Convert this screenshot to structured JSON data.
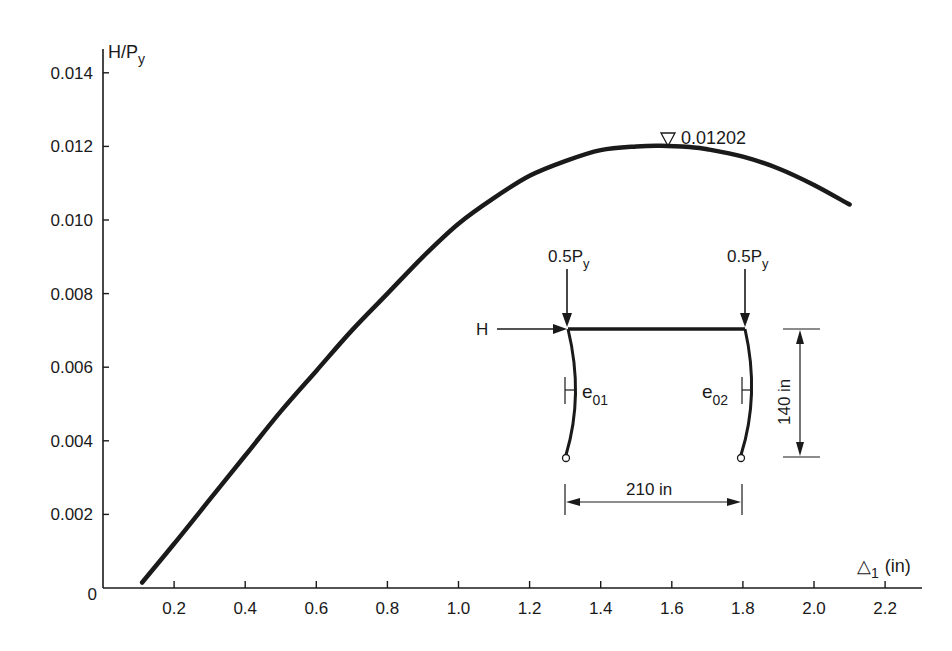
{
  "chart_data": {
    "type": "line",
    "title": "",
    "xlabel": "Δ1 (in)",
    "ylabel": "H/Py",
    "xlim": [
      0,
      2.3
    ],
    "ylim": [
      0,
      0.0145
    ],
    "grid": false,
    "legend": null,
    "x_ticks": [
      0.2,
      0.4,
      0.6,
      0.8,
      1.0,
      1.2,
      1.4,
      1.6,
      1.8,
      2.0,
      2.2
    ],
    "x_tick_labels": [
      "0.2",
      "0.4",
      "0.6",
      "0.8",
      "1.0",
      "1.2",
      "1.4",
      "1.6",
      "1.8",
      "2.0",
      "2.2"
    ],
    "y_ticks": [
      0,
      0.002,
      0.004,
      0.006,
      0.008,
      0.01,
      0.012,
      0.014
    ],
    "y_tick_labels": [
      "0",
      "0.002",
      "0.004",
      "0.006",
      "0.008",
      "0.010",
      "0.012",
      "0.014"
    ],
    "series": [
      {
        "name": "H/Py vs Δ1",
        "x": [
          0.11,
          0.2,
          0.3,
          0.4,
          0.5,
          0.6,
          0.7,
          0.8,
          0.9,
          1.0,
          1.1,
          1.2,
          1.3,
          1.4,
          1.5,
          1.57,
          1.65,
          1.7,
          1.8,
          1.9,
          2.0,
          2.1
        ],
        "y": [
          0.00015,
          0.0012,
          0.0024,
          0.0036,
          0.0048,
          0.0059,
          0.007,
          0.008,
          0.009,
          0.0099,
          0.0106,
          0.0112,
          0.0116,
          0.0119,
          0.012,
          0.01202,
          0.01198,
          0.01192,
          0.01172,
          0.0114,
          0.01095,
          0.01042
        ]
      }
    ],
    "annotations": [
      {
        "text": "0.01202",
        "marker": "▽",
        "x": 1.57,
        "y": 0.01202,
        "meaning": "peak value"
      }
    ],
    "inset_diagram": {
      "description": "Portal frame: two pin-based columns with initial crookedness, rigid beam on top",
      "load_left": "0.5Py",
      "load_right": "0.5Py",
      "horizontal_load": "H",
      "imperfection_left": "e01",
      "imperfection_right": "e02",
      "height": "140 in",
      "span": "210 in"
    }
  },
  "labels": {
    "ylabel_main": "H/P",
    "ylabel_sub": "y",
    "xlabel_delta": "△",
    "xlabel_sub": "1",
    "xlabel_unit": "(in)",
    "peak_marker": "▽",
    "peak_value": "0.01202",
    "load_left_main": "0.5P",
    "load_left_sub": "y",
    "load_right_main": "0.5P",
    "load_right_sub": "y",
    "h_label": "H",
    "e01_main": "e",
    "e01_sub": "01",
    "e02_main": "e",
    "e02_sub": "02",
    "height_dim": "140 in",
    "span_dim": "210 in",
    "zero": "0"
  },
  "colors": {
    "ink": "#1a1a1a",
    "background": "#ffffff"
  }
}
